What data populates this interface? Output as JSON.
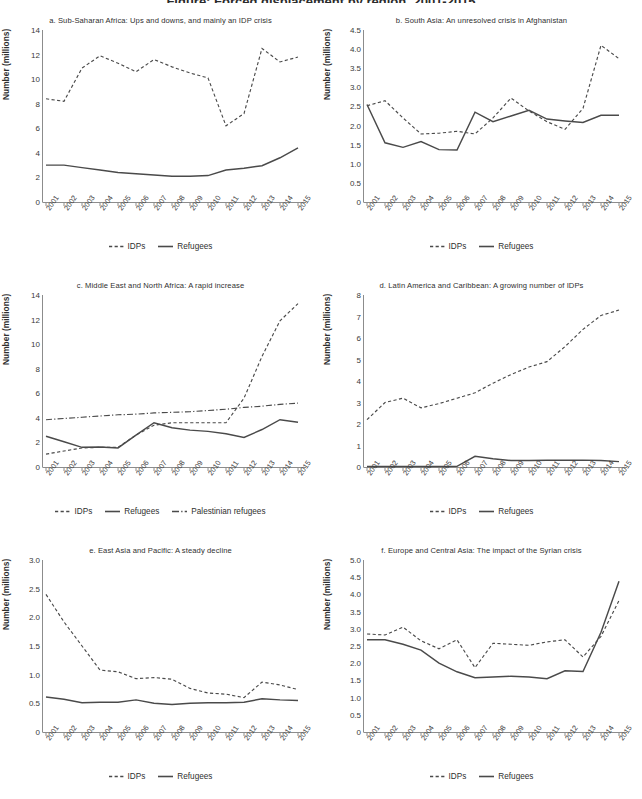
{
  "figure": {
    "title": "Figure: Forced displacement by region, 2001-2015",
    "ylabel": "Number (millions)",
    "years": [
      "2001",
      "2002",
      "2003",
      "2004",
      "2005",
      "2006",
      "2007",
      "2008",
      "2009",
      "2010",
      "2011",
      "2012",
      "2013",
      "2014",
      "2015"
    ],
    "legend_labels": {
      "idps": "IDPs",
      "refugees": "Refugees",
      "palestinian": "Palestinian refugees"
    }
  },
  "chart_data": [
    {
      "id": "a",
      "type": "line",
      "title": "a. Sub-Saharan Africa: Ups and downs, and mainly an IDP crisis",
      "xlabel": "",
      "ylabel": "Number (millions)",
      "x": [
        "2001",
        "2002",
        "2003",
        "2004",
        "2005",
        "2006",
        "2007",
        "2008",
        "2009",
        "2010",
        "2011",
        "2012",
        "2013",
        "2014",
        "2015"
      ],
      "ylim": [
        0,
        14
      ],
      "yticks": [
        0,
        2,
        4,
        6,
        8,
        10,
        12,
        14
      ],
      "ytick_labels": [
        "0",
        "2",
        "4",
        "6",
        "8",
        "10",
        "12",
        "14"
      ],
      "grid": false,
      "legend_position": "bottom",
      "series": [
        {
          "name": "IDPs",
          "style": "dashed",
          "values": [
            8.4,
            8.2,
            10.9,
            11.9,
            11.3,
            10.6,
            11.6,
            11.0,
            10.5,
            10.1,
            6.2,
            7.2,
            12.5,
            11.4,
            11.8
          ]
        },
        {
          "name": "Refugees",
          "style": "solid",
          "values": [
            3.0,
            3.0,
            2.8,
            2.6,
            2.4,
            2.3,
            2.2,
            2.1,
            2.1,
            2.15,
            2.6,
            2.75,
            2.95,
            3.6,
            4.4
          ]
        }
      ]
    },
    {
      "id": "b",
      "type": "line",
      "title": "b. South Asia: An unresolved crisis in Afghanistan",
      "xlabel": "",
      "ylabel": "Number (millions)",
      "x": [
        "2001",
        "2002",
        "2003",
        "2004",
        "2005",
        "2006",
        "2007",
        "2008",
        "2009",
        "2010",
        "2011",
        "2012",
        "2013",
        "2014",
        "2015"
      ],
      "ylim": [
        0,
        4.5
      ],
      "yticks": [
        0,
        0.5,
        1.0,
        1.5,
        2.0,
        2.5,
        3.0,
        3.5,
        4.0,
        4.5
      ],
      "ytick_labels": [
        "0",
        "0.5",
        "1.0",
        "1.5",
        "2.0",
        "2.5",
        "3.0",
        "3.5",
        "4.0",
        "4.5"
      ],
      "grid": false,
      "legend_position": "bottom",
      "series": [
        {
          "name": "IDPs",
          "style": "dashed",
          "values": [
            2.52,
            2.65,
            2.2,
            1.78,
            1.8,
            1.85,
            1.78,
            2.2,
            2.72,
            2.38,
            2.1,
            1.9,
            2.45,
            4.1,
            3.75
          ]
        },
        {
          "name": "Refugees",
          "style": "solid",
          "values": [
            2.55,
            1.55,
            1.43,
            1.58,
            1.37,
            1.36,
            2.35,
            2.1,
            2.25,
            2.4,
            2.17,
            2.12,
            2.08,
            2.27,
            2.27
          ]
        }
      ]
    },
    {
      "id": "c",
      "type": "line",
      "title": "c. Middle East and North Africa: A rapid increase",
      "xlabel": "",
      "ylabel": "Number (millions)",
      "x": [
        "2001",
        "2002",
        "2003",
        "2004",
        "2005",
        "2006",
        "2007",
        "2008",
        "2009",
        "2010",
        "2011",
        "2012",
        "2013",
        "2014",
        "2015"
      ],
      "ylim": [
        0,
        14
      ],
      "yticks": [
        0,
        2,
        4,
        6,
        8,
        10,
        12,
        14
      ],
      "ytick_labels": [
        "0",
        "2",
        "4",
        "6",
        "8",
        "10",
        "12",
        "14"
      ],
      "grid": false,
      "legend_position": "bottom",
      "series": [
        {
          "name": "IDPs",
          "style": "dashed",
          "values": [
            1.05,
            1.3,
            1.55,
            1.6,
            1.6,
            2.6,
            3.4,
            3.6,
            3.6,
            3.6,
            3.6,
            5.6,
            9.0,
            11.9,
            13.3
          ]
        },
        {
          "name": "Refugees",
          "style": "solid",
          "values": [
            2.5,
            2.05,
            1.6,
            1.62,
            1.55,
            2.6,
            3.6,
            3.2,
            3.0,
            2.9,
            2.7,
            2.4,
            3.05,
            3.85,
            3.65
          ]
        },
        {
          "name": "Palestinian refugees",
          "style": "dashdot",
          "values": [
            3.85,
            3.95,
            4.05,
            4.15,
            4.25,
            4.3,
            4.4,
            4.45,
            4.5,
            4.6,
            4.7,
            4.85,
            4.95,
            5.1,
            5.2
          ]
        }
      ]
    },
    {
      "id": "d",
      "type": "line",
      "title": "d. Latin America and Caribbean: A growing number of IDPs",
      "xlabel": "",
      "ylabel": "Number (millions)",
      "x": [
        "2001",
        "2002",
        "2003",
        "2004",
        "2005",
        "2006",
        "2007",
        "2008",
        "2009",
        "2010",
        "2011",
        "2012",
        "2013",
        "2014",
        "2015"
      ],
      "ylim": [
        0,
        8
      ],
      "yticks": [
        0,
        1,
        2,
        3,
        4,
        5,
        6,
        7,
        8
      ],
      "ytick_labels": [
        "0",
        "1",
        "2",
        "3",
        "4",
        "5",
        "6",
        "7",
        "8"
      ],
      "grid": false,
      "legend_position": "bottom",
      "series": [
        {
          "name": "IDPs",
          "style": "dashed",
          "values": [
            2.2,
            3.0,
            3.2,
            2.75,
            2.95,
            3.2,
            3.45,
            3.9,
            4.3,
            4.65,
            4.9,
            5.6,
            6.4,
            7.05,
            7.3
          ]
        },
        {
          "name": "Refugees",
          "style": "solid",
          "values": [
            0.02,
            0.02,
            0.02,
            0.02,
            0.02,
            0.03,
            0.5,
            0.38,
            0.3,
            0.3,
            0.31,
            0.31,
            0.32,
            0.3,
            0.25
          ]
        }
      ]
    },
    {
      "id": "e",
      "type": "line",
      "title": "e. East Asia and Pacific: A steady decline",
      "xlabel": "",
      "ylabel": "Number (millions)",
      "x": [
        "2001",
        "2002",
        "2003",
        "2004",
        "2005",
        "2006",
        "2007",
        "2008",
        "2009",
        "2010",
        "2011",
        "2012",
        "2013",
        "2014",
        "2015"
      ],
      "ylim": [
        0,
        3.0
      ],
      "yticks": [
        0,
        0.5,
        1.0,
        1.5,
        2.0,
        2.5,
        3.0
      ],
      "ytick_labels": [
        "0",
        "0.5",
        "1.0",
        "1.5",
        "2.0",
        "2.5",
        "3.0"
      ],
      "grid": false,
      "legend_position": "bottom",
      "series": [
        {
          "name": "IDPs",
          "style": "dashed",
          "values": [
            2.4,
            1.92,
            1.5,
            1.08,
            1.05,
            0.93,
            0.95,
            0.92,
            0.76,
            0.68,
            0.66,
            0.6,
            0.87,
            0.82,
            0.74
          ]
        },
        {
          "name": "Refugees",
          "style": "solid",
          "values": [
            0.61,
            0.57,
            0.51,
            0.52,
            0.52,
            0.56,
            0.5,
            0.48,
            0.5,
            0.51,
            0.51,
            0.52,
            0.58,
            0.56,
            0.55
          ]
        }
      ]
    },
    {
      "id": "f",
      "type": "line",
      "title": "f. Europe and Central Asia: The impact of the Syrian crisis",
      "xlabel": "",
      "ylabel": "Number (millions)",
      "x": [
        "2001",
        "2002",
        "2003",
        "2004",
        "2005",
        "2006",
        "2007",
        "2008",
        "2009",
        "2010",
        "2011",
        "2012",
        "2013",
        "2014",
        "2015"
      ],
      "ylim": [
        0,
        5.0
      ],
      "yticks": [
        0,
        0.5,
        1.0,
        1.5,
        2.0,
        2.5,
        3.0,
        3.5,
        4.0,
        4.5,
        5.0
      ],
      "ytick_labels": [
        "0",
        "0.5",
        "1.0",
        "1.5",
        "2.0",
        "2.5",
        "3.0",
        "3.5",
        "4.0",
        "4.5",
        "5.0"
      ],
      "grid": false,
      "legend_position": "bottom",
      "series": [
        {
          "name": "IDPs",
          "style": "dashed",
          "values": [
            2.85,
            2.82,
            3.05,
            2.65,
            2.42,
            2.68,
            1.87,
            2.58,
            2.55,
            2.52,
            2.62,
            2.68,
            2.18,
            2.78,
            3.82
          ]
        },
        {
          "name": "Refugees",
          "style": "solid",
          "values": [
            2.68,
            2.68,
            2.55,
            2.38,
            2.0,
            1.75,
            1.58,
            1.6,
            1.62,
            1.6,
            1.55,
            1.78,
            1.76,
            2.9,
            4.38
          ]
        }
      ]
    }
  ]
}
